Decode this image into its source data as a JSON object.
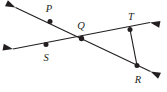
{
  "figure": {
    "background_color": "#ffffff",
    "ink_color": "#231f20",
    "width": 167,
    "height": 92
  },
  "labels": {
    "p": "P",
    "q": "Q",
    "s": "S",
    "t": "T",
    "r": "R"
  },
  "points": [
    {
      "name": "P",
      "x": 50,
      "y": 21.5
    },
    {
      "name": "Q",
      "x": 81.5,
      "y": 38.5
    },
    {
      "name": "S",
      "x": 46,
      "y": 44.5
    },
    {
      "name": "T",
      "x": 130,
      "y": 29.5
    },
    {
      "name": "R",
      "x": 137,
      "y": 65.5
    }
  ],
  "label_positions": [
    {
      "name": "P",
      "x": 49,
      "y": 12
    },
    {
      "name": "Q",
      "x": 81,
      "y": 29
    },
    {
      "name": "S",
      "x": 46,
      "y": 61
    },
    {
      "name": "T",
      "x": 131,
      "y": 20
    },
    {
      "name": "R",
      "x": 138,
      "y": 83
    }
  ],
  "lines": [
    {
      "name": "line-P-Q-R",
      "description": "double-headed line through P, Q, and R",
      "x1": 15.5,
      "y1": 7.5,
      "x2": 150.5,
      "y2": 71.5,
      "arrow_start": true,
      "arrow_end": true
    },
    {
      "name": "line-S-Q-T",
      "description": "double-headed line through S, Q, and T",
      "x1": 13.0,
      "y1": 49.0,
      "x2": 150.0,
      "y2": 22.5,
      "arrow_start": true,
      "arrow_end": true
    }
  ],
  "segments": [
    {
      "name": "segment-T-R",
      "description": "segment joining T and R",
      "x1": 130,
      "y1": 29.5,
      "x2": 137,
      "y2": 65.5
    }
  ],
  "arrowheads": [
    {
      "name": "arrow-upper-left",
      "x": 15.5,
      "y": 7.5,
      "angle": 205.3
    },
    {
      "name": "arrow-lower-right",
      "x": 150.5,
      "y": 71.5,
      "angle": 25.3
    },
    {
      "name": "arrow-left",
      "x": 13.0,
      "y": 49.0,
      "angle": 191.0
    },
    {
      "name": "arrow-right",
      "x": 150.0,
      "y": 22.5,
      "angle": 11.0
    }
  ]
}
